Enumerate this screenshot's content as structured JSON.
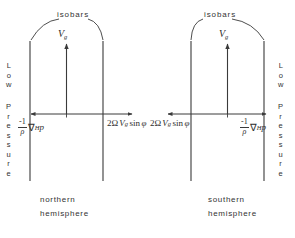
{
  "figure": {
    "background_color": "#ffffff",
    "ink_color": "#333333",
    "panels": [
      {
        "id": "northern",
        "isobars_label": "isobars",
        "wind_label": "V",
        "wind_label_sub": "g",
        "caption_line1": "northern",
        "caption_line2": "hemisphere",
        "margin_text_top": "Low",
        "margin_text_bottom": "Pressure",
        "margin_side": "left",
        "force_left": {
          "name": "pressure-gradient-force",
          "frac_num": "-1",
          "frac_den": "ρ",
          "operator": "∇",
          "operator_sub": "H",
          "variable": "p",
          "arrow_direction": "left"
        },
        "force_right": {
          "name": "coriolis-force",
          "text_parts": [
            "2",
            "Ω",
            "V",
            "g",
            "sin",
            "φ"
          ],
          "arrow_direction": "right"
        }
      },
      {
        "id": "southern",
        "isobars_label": "isobars",
        "wind_label": "V",
        "wind_label_sub": "g",
        "caption_line1": "southern",
        "caption_line2": "hemisphere",
        "margin_text_top": "Low",
        "margin_text_bottom": "Pressure",
        "margin_side": "right",
        "force_left": {
          "name": "coriolis-force",
          "text_parts": [
            "2",
            "Ω",
            "V",
            "g",
            "sin",
            "φ"
          ],
          "arrow_direction": "left"
        },
        "force_right": {
          "name": "pressure-gradient-force",
          "frac_num": "-1",
          "frac_den": "ρ",
          "operator": "∇",
          "operator_sub": "H",
          "variable": "p",
          "arrow_direction": "right"
        }
      }
    ],
    "margin_letters": {
      "low": [
        "L",
        "o",
        "w"
      ],
      "pressure": [
        "P",
        "r",
        "e",
        "s",
        "s",
        "u",
        "r",
        "e"
      ]
    }
  }
}
